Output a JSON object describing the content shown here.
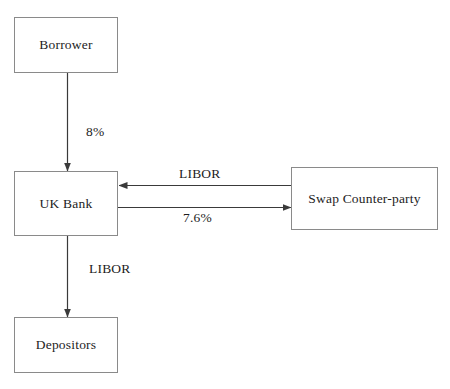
{
  "diagram": {
    "background_color": "#ffffff",
    "line_color": "#3a3a3a",
    "border_color": "#8a8a8a",
    "text_color": "#1d1d1d",
    "nodes": [
      {
        "id": "borrower",
        "label": "Borrower"
      },
      {
        "id": "uk_bank",
        "label": "UK Bank"
      },
      {
        "id": "depositors",
        "label": "Depositors"
      },
      {
        "id": "swap",
        "label": "Swap Counter-party"
      }
    ],
    "edges": [
      {
        "id": "borrower_to_bank",
        "from": "borrower",
        "to": "uk_bank",
        "label": "8%",
        "direction": "down"
      },
      {
        "id": "swap_to_bank",
        "from": "swap",
        "to": "uk_bank",
        "label": "LIBOR",
        "direction": "left"
      },
      {
        "id": "bank_to_swap",
        "from": "uk_bank",
        "to": "swap",
        "label": "7.6%",
        "direction": "right"
      },
      {
        "id": "bank_to_depositors",
        "from": "uk_bank",
        "to": "depositors",
        "label": "LIBOR",
        "direction": "down"
      }
    ]
  }
}
